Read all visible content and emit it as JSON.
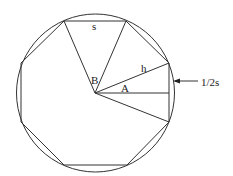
{
  "diagram": {
    "labels": {
      "side": "s",
      "angle_b": "B",
      "apothem_hyp": "h",
      "angle_a": "A",
      "half_side": "1/2s"
    },
    "colors": {
      "stroke": "#333333",
      "background": "#ffffff",
      "text": "#222222"
    }
  }
}
